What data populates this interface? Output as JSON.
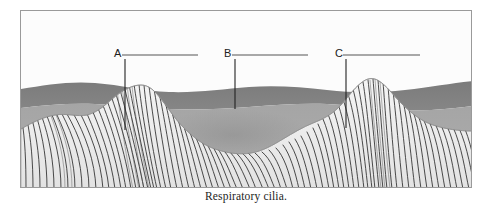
{
  "figure": {
    "caption": "Respiratory cilia.",
    "frame": {
      "x": 20,
      "y": 10,
      "width": 452,
      "height": 178
    },
    "background_color": "#fdfdfd",
    "border_color": "#9a9a9a"
  },
  "layers": {
    "mucus_dark": {
      "name": "dark mucus band",
      "color": "#7f7f7f"
    },
    "mucus_light": {
      "name": "light periciliary layer",
      "color": "#a8a8a8"
    },
    "cilia": {
      "name": "cilia field",
      "color": "#efefef",
      "stroke_color": "#2a2a2a"
    }
  },
  "labels": [
    {
      "letter": "A",
      "letter_x": 114,
      "letter_y": 57,
      "line_x1": 122,
      "line_x2": 198,
      "line_y": 54,
      "leader_x": 124,
      "leader_y1": 57,
      "leader_y2": 128,
      "answer_text": ""
    },
    {
      "letter": "B",
      "letter_x": 224,
      "letter_y": 57,
      "line_x1": 232,
      "line_x2": 308,
      "line_y": 54,
      "leader_x": 234,
      "leader_y1": 57,
      "leader_y2": 107,
      "answer_text": ""
    },
    {
      "letter": "C",
      "letter_x": 335,
      "letter_y": 57,
      "line_x1": 343,
      "line_x2": 420,
      "line_y": 54,
      "leader_x": 345,
      "leader_y1": 57,
      "leader_y2": 126,
      "answer_text": ""
    }
  ],
  "colors": {
    "leader_line": "#222222",
    "answer_line": "#555555",
    "caption_text": "#1d1d1d"
  }
}
